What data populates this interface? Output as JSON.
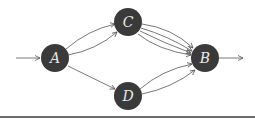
{
  "diagram": {
    "type": "directed-multigraph",
    "nodes": [
      {
        "id": "A",
        "label": "A",
        "x": 55,
        "y": 58
      },
      {
        "id": "C",
        "label": "C",
        "x": 128,
        "y": 22
      },
      {
        "id": "D",
        "label": "D",
        "x": 128,
        "y": 96
      },
      {
        "id": "B",
        "label": "B",
        "x": 205,
        "y": 58
      }
    ],
    "node_radius": 14,
    "node_fill": "#3a3a3a",
    "label_color": "#e8e8e8",
    "edge_color": "#555555",
    "edges": [
      {
        "from": "A",
        "to": "C",
        "count": 2
      },
      {
        "from": "A",
        "to": "D",
        "count": 1
      },
      {
        "from": "C",
        "to": "B",
        "count": 4
      },
      {
        "from": "D",
        "to": "B",
        "count": 2
      }
    ],
    "source_arrow": {
      "to": "A"
    },
    "sink_arrow": {
      "from": "B"
    }
  }
}
